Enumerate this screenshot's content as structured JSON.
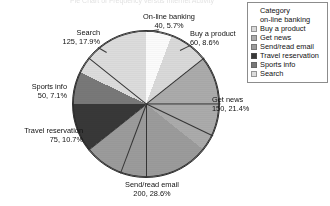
{
  "chart_data": {
    "type": "pie",
    "title": "Pie Chart of Frequency versus Internet Activity",
    "categories": [
      "on-line banking",
      "Buy a product",
      "Get news",
      "Send/read email",
      "Travel reservation",
      "Sports info",
      "Search"
    ],
    "values": [
      40,
      60,
      150,
      200,
      75,
      50,
      125
    ],
    "percents": [
      "5.7%",
      "8.6%",
      "21.4%",
      "28.6%",
      "10.7%",
      "7.1%",
      "17.9%"
    ],
    "total": 700,
    "colors": [
      "#fbfbfb",
      "#d9d9d9",
      "#ababab",
      "#9b9b9b",
      "#383838",
      "#787878",
      "#dcdcdc"
    ],
    "legend_position": "top-right",
    "grid": false,
    "xlabel": "",
    "ylabel": ""
  },
  "labels": {
    "online_banking": {
      "name": "On-line banking",
      "value": "40, 5.7%"
    },
    "buy_product": {
      "name": "Buy a product",
      "value": "60, 8.6%"
    },
    "get_news": {
      "name": "Get news",
      "value": "150, 21.4%"
    },
    "send_email": {
      "name": "Send/read email",
      "value": "200, 28.6%"
    },
    "travel": {
      "name": "Travel reservation",
      "value": "75, 10.7%"
    },
    "sports": {
      "name": "Sports info",
      "value": "50, 7.1%"
    },
    "search": {
      "name": "Search",
      "value": "125, 17.9%"
    }
  },
  "legend": {
    "header": "Category",
    "items": [
      {
        "label": "on-line banking",
        "swatch": "#ffffff",
        "has_swatch": false
      },
      {
        "label": "Buy a product",
        "swatch": "#d9d9d9",
        "has_swatch": true
      },
      {
        "label": "Get news",
        "swatch": "#ababab",
        "has_swatch": true
      },
      {
        "label": "Send/read email",
        "swatch": "#9b9b9b",
        "has_swatch": true
      },
      {
        "label": "Travel reservation",
        "swatch": "#383838",
        "has_swatch": true
      },
      {
        "label": "Sports info",
        "swatch": "#787878",
        "has_swatch": true
      },
      {
        "label": "Search",
        "swatch": "#dcdcdc",
        "has_swatch": true
      }
    ]
  }
}
